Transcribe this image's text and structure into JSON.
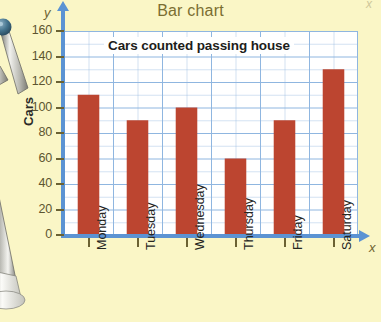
{
  "chart_data": {
    "type": "bar",
    "title": "Bar chart",
    "caption": "Cars counted passing house",
    "categories": [
      "Monday",
      "Tuesday",
      "Wednesday",
      "Thursday",
      "Friday",
      "Saturday"
    ],
    "values": [
      110,
      90,
      100,
      60,
      90,
      130
    ],
    "xlabel": "x",
    "ylabel": "Cars",
    "yaxis_letter": "y",
    "xaxis_letter": "x",
    "ylim": [
      0,
      160
    ],
    "ytick_values": [
      160,
      140,
      120,
      100,
      80,
      60,
      40,
      20,
      0
    ],
    "ytick_labels": [
      "160",
      "140",
      "120",
      "100",
      "80",
      "60",
      "40",
      "20",
      "0"
    ],
    "ytick_step": 20,
    "minor_gridline_step": 10,
    "grid": true,
    "legend": "none",
    "bar_color": "#bc4530",
    "gridline_color": "#8fb6e0",
    "axis_color": "#5b93d3",
    "plot_background": "#ffffff",
    "page_background": "#faf6c6",
    "title_color": "#7a6e32"
  },
  "decoration": {
    "compass_upper_name": "compass-hinge",
    "compass_lower_name": "compass-leg"
  }
}
